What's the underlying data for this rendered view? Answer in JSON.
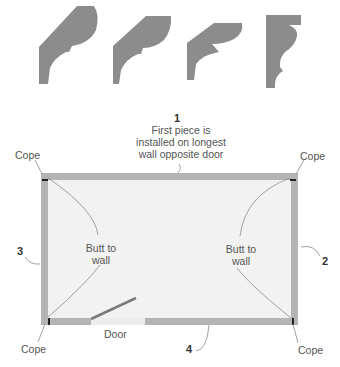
{
  "profiles": [
    {
      "name": "crown-molding-profile-1"
    },
    {
      "name": "crown-molding-profile-2"
    },
    {
      "name": "crown-molding-profile-3"
    },
    {
      "name": "crown-molding-profile-4"
    }
  ],
  "callouts": {
    "first": {
      "number": "1",
      "line1": "First piece is",
      "line2": "installed on longest",
      "line3": "wall opposite door"
    },
    "wall2": {
      "number": "2"
    },
    "wall3": {
      "number": "3"
    },
    "wall4": {
      "number": "4"
    }
  },
  "labels": {
    "cope_top_left": "Cope",
    "cope_top_right": "Cope",
    "cope_bottom_left": "Cope",
    "cope_bottom_right": "Cope",
    "butt_left_line1": "Butt to",
    "butt_left_line2": "wall",
    "butt_right_line1": "Butt to",
    "butt_right_line2": "wall",
    "door": "Door"
  },
  "colors": {
    "molding": "#8c8c8c",
    "wall": "#b4b4b4",
    "floor": "#f2f2f2",
    "leader": "#888888",
    "door_opening": "#ececec"
  }
}
